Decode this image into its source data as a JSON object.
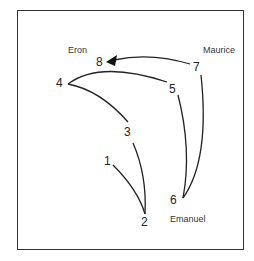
{
  "diagram": {
    "type": "movement-path",
    "people": [
      {
        "name": "Eron",
        "x": 68,
        "y": 46
      },
      {
        "name": "Maurice",
        "x": 203,
        "y": 46
      },
      {
        "name": "Emanuel",
        "x": 170,
        "y": 215
      }
    ],
    "points": [
      {
        "label": "1",
        "x": 104,
        "y": 155
      },
      {
        "label": "2",
        "x": 141,
        "y": 215
      },
      {
        "label": "3",
        "x": 124,
        "y": 125
      },
      {
        "label": "4",
        "x": 55,
        "y": 78
      },
      {
        "label": "5",
        "x": 170,
        "y": 82
      },
      {
        "label": "6",
        "x": 164,
        "y": 193
      },
      {
        "label": "7",
        "x": 192,
        "y": 61
      },
      {
        "label": "8",
        "x": 96,
        "y": 56
      }
    ],
    "segments": [
      {
        "from": "1",
        "to": "2"
      },
      {
        "from": "2",
        "to": "3"
      },
      {
        "from": "3",
        "to": "4"
      },
      {
        "from": "4",
        "to": "5"
      },
      {
        "from": "5",
        "to": "6"
      },
      {
        "from": "6",
        "to": "7"
      },
      {
        "from": "7",
        "to": "8",
        "arrow": true
      }
    ],
    "line_color": "#222222"
  }
}
